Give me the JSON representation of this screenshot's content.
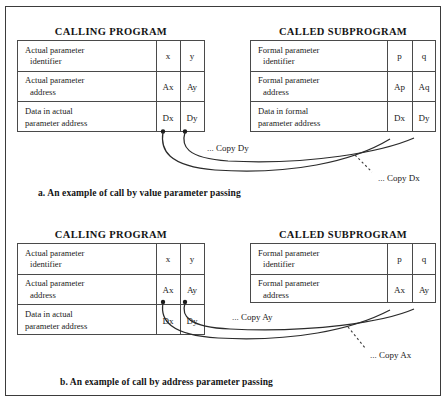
{
  "figure": {
    "diagrams": [
      {
        "id": "call-by-value",
        "caption": "a. An example of call by value parameter passing",
        "left_panel": {
          "title": "CALLING PROGRAM",
          "rows": [
            {
              "label_line1": "Actual  parameter",
              "label_line2": "identifier",
              "col1": "x",
              "col2": "y"
            },
            {
              "label_line1": "Actual  parameter",
              "label_line2": "address",
              "col1": "Ax",
              "col2": "Ay"
            },
            {
              "label_line1": "Data in actual",
              "label_line2": "parameter address",
              "col1": "Dx",
              "col2": "Dy"
            }
          ]
        },
        "right_panel": {
          "title": "CALLED SUBPROGRAM",
          "rows": [
            {
              "label_line1": "Formal  parameter",
              "label_line2": "identifier",
              "col1": "p",
              "col2": "q"
            },
            {
              "label_line1": "Formal  parameter",
              "label_line2": "address",
              "col1": "Ap",
              "col2": "Aq"
            },
            {
              "label_line1": "Data in formal",
              "label_line2": "parameter address",
              "col1": "Dx",
              "col2": "Dy"
            }
          ]
        },
        "annotations": [
          {
            "id": "copy-dy",
            "text": "Copy Dy"
          },
          {
            "id": "copy-dx",
            "text": "Copy Dx"
          }
        ]
      },
      {
        "id": "call-by-address",
        "caption": "b. An example of call by address parameter passing",
        "left_panel": {
          "title": "CALLING PROGRAM",
          "rows": [
            {
              "label_line1": "Actual  parameter",
              "label_line2": "identifier",
              "col1": "x",
              "col2": "y"
            },
            {
              "label_line1": "Actual  parameter",
              "label_line2": "address",
              "col1": "Ax",
              "col2": "Ay"
            },
            {
              "label_line1": "Data in actual",
              "label_line2": "parameter address",
              "col1": "Dx",
              "col2": "Dy"
            }
          ]
        },
        "right_panel": {
          "title": "CALLED SUBPROGRAM",
          "rows": [
            {
              "label_line1": "Formal  parameter",
              "label_line2": "identifier",
              "col1": "p",
              "col2": "q"
            },
            {
              "label_line1": "Formal  parameter",
              "label_line2": "address",
              "col1": "Ax",
              "col2": "Ay"
            }
          ]
        },
        "annotations": [
          {
            "id": "copy-ay",
            "text": "Copy Ay"
          },
          {
            "id": "copy-ax",
            "text": "Copy Ax"
          }
        ]
      }
    ],
    "colors": {
      "ink": "#1a1a1a",
      "rule": "#4a4a4a",
      "frame": "#3b3b3b",
      "background": "#ffffff"
    },
    "leader_dots": "..."
  }
}
